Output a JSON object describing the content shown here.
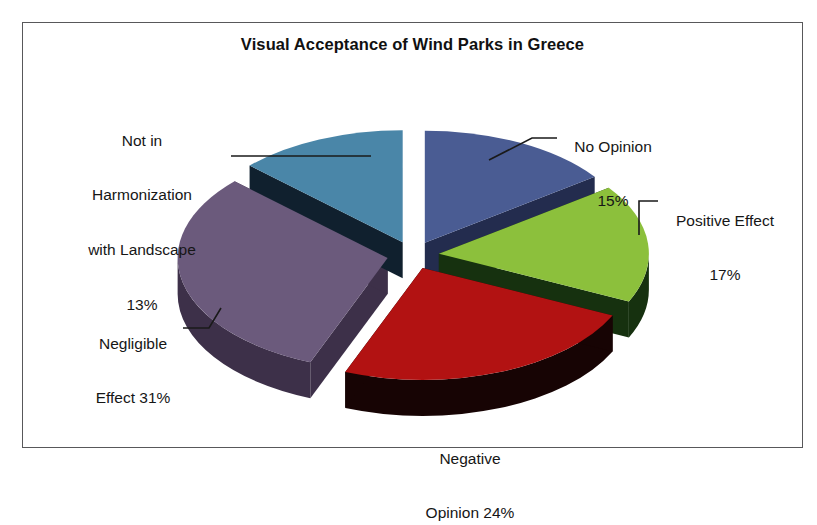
{
  "chart": {
    "title": "Visual Acceptance of Wind Parks in Greece",
    "frame_color": "#58585a",
    "background": "#ffffff"
  },
  "labels": {
    "harmonization": {
      "line1": "Not in",
      "line2": "Harmonization",
      "line3": "with Landscape",
      "line4": "13%"
    },
    "no_opinion": {
      "line1": "No Opinion",
      "line2": "15%"
    },
    "positive": {
      "line1": "Positive Effect",
      "line2": "17%"
    },
    "negligible": {
      "line1": "Negligible",
      "line2": "Effect 31%"
    },
    "negative": {
      "line1": "Negative",
      "line2": "Opinion 24%"
    }
  },
  "chart_data": {
    "type": "pie",
    "title": "Visual Acceptance of Wind Parks in Greece",
    "xlabel": "",
    "ylabel": "",
    "legend": "none",
    "style": "3d-exploded",
    "units": "percent",
    "total": 100,
    "categories": [
      "No Opinion",
      "Positive Effect",
      "Negative Opinion",
      "Negligible Effect",
      "Not in Harmonization with Landscape"
    ],
    "values": [
      15,
      17,
      24,
      31,
      13
    ],
    "slices": [
      {
        "label": "No Opinion",
        "value": 15,
        "display": "No Opinion 15%",
        "color": "#4a5c93",
        "side_color": "#232c4e",
        "start_deg": 0,
        "end_deg": 54
      },
      {
        "label": "Positive Effect",
        "value": 17,
        "display": "Positive Effect 17%",
        "color": "#8cc03c",
        "side_color": "#16310f",
        "start_deg": 54,
        "end_deg": 115.2
      },
      {
        "label": "Negative Opinion",
        "value": 24,
        "display": "Negative Opinion 24%",
        "color": "#b21212",
        "side_color": "#170404",
        "start_deg": 115.2,
        "end_deg": 201.6
      },
      {
        "label": "Negligible Effect",
        "value": 31,
        "display": "Negligible Effect 31%",
        "color": "#6b5a7c",
        "side_color": "#3d3049",
        "start_deg": 201.6,
        "end_deg": 313.2
      },
      {
        "label": "Not in Harmonization with Landscape",
        "value": 13,
        "display": "Not in Harmonization with Landscape 13%",
        "color": "#4a86a8",
        "side_color": "#10202e",
        "start_deg": 313.2,
        "end_deg": 360
      }
    ]
  }
}
